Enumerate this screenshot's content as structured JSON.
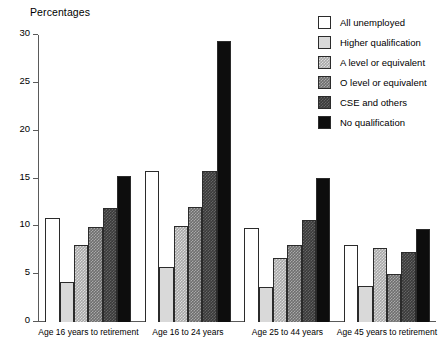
{
  "chart_data": {
    "type": "bar",
    "title": "",
    "ylabel": "Percentages",
    "xlabel": "",
    "ylim": [
      0,
      30
    ],
    "yticks": [
      0,
      5,
      10,
      15,
      20,
      25,
      30
    ],
    "grid": false,
    "legend_position": "top-right",
    "categories": [
      "Age 16 years to retirement",
      "Age 16 to 24 years",
      "Age 25 to 44 years",
      "Age 45 years to retirement"
    ],
    "series": [
      {
        "name": "All unemployed",
        "color": "#ffffff",
        "values": [
          10.9,
          15.8,
          9.8,
          8.0
        ]
      },
      {
        "name": "Higher qualification",
        "color": "#d9d9d9",
        "values": [
          4.2,
          5.8,
          3.7,
          3.8
        ]
      },
      {
        "name": "A level or equivalent",
        "color": "#a8a8a8",
        "values": [
          8.0,
          10.0,
          6.7,
          7.7
        ]
      },
      {
        "name": "O level or equivalent",
        "color": "#6e6e6e",
        "values": [
          9.9,
          12.0,
          8.0,
          5.0
        ]
      },
      {
        "name": "CSE and others",
        "color": "#3a3a3a",
        "values": [
          11.9,
          15.8,
          10.7,
          7.3
        ]
      },
      {
        "name": "No qualification",
        "color": "#0d0d0d",
        "values": [
          15.3,
          29.4,
          15.1,
          9.7
        ]
      }
    ]
  },
  "legend": {
    "items": [
      {
        "label": "All unemployed"
      },
      {
        "label": "Higher qualification"
      },
      {
        "label": "A level or equivalent"
      },
      {
        "label": "O level or equivalent"
      },
      {
        "label": "CSE and others"
      },
      {
        "label": "No qualification"
      }
    ]
  }
}
